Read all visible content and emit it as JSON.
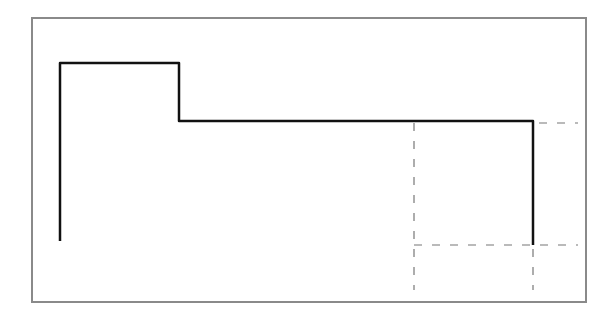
{
  "diagram": {
    "type": "step-profile-line-drawing",
    "frame": {
      "x": 32,
      "y": 18,
      "width": 554,
      "height": 284,
      "color": "#8a8a8a"
    },
    "solid_path": {
      "color": "#111111",
      "points": [
        [
          60,
          241
        ],
        [
          60,
          63
        ],
        [
          179,
          63
        ],
        [
          179,
          121
        ],
        [
          533,
          121
        ],
        [
          533,
          245
        ]
      ]
    },
    "dashed_lines": [
      {
        "x1": 414,
        "y1": 123,
        "x2": 414,
        "y2": 290
      },
      {
        "x1": 533,
        "y1": 249,
        "x2": 533,
        "y2": 290
      },
      {
        "x1": 414,
        "y1": 245,
        "x2": 578,
        "y2": 245
      },
      {
        "x1": 539,
        "y1": 123,
        "x2": 578,
        "y2": 123
      }
    ],
    "dashed_color": "#777777"
  }
}
